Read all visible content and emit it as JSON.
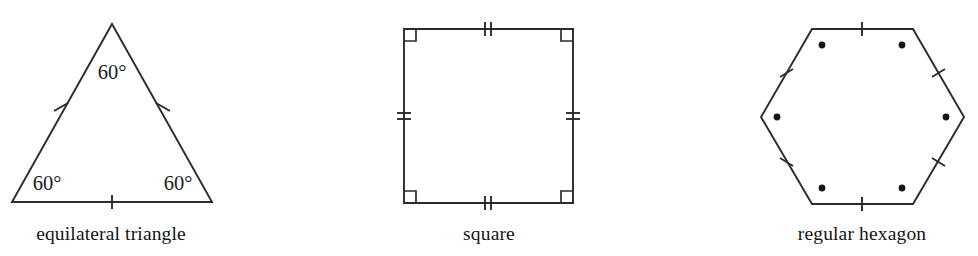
{
  "figure": {
    "background_color": "#ffffff",
    "stroke_color": "#2b2b2e",
    "text_color": "#141417",
    "shapes": [
      {
        "name": "equilateral-triangle",
        "caption": "equilateral triangle",
        "caption_x": 111,
        "caption_y": 240,
        "sides": 3,
        "tick_count": 1,
        "vertex_marker": "none",
        "has_right_angle_marks": false,
        "angle_labels": [
          {
            "text": "60°",
            "x": 112,
            "y": 79
          },
          {
            "text": "60°",
            "x": 47,
            "y": 190
          },
          {
            "text": "60°",
            "x": 178,
            "y": 190
          }
        ],
        "points": "112,24 212,202 12,202",
        "tick_segments": [
          {
            "x1": 54,
            "y1": 111,
            "x2": 68,
            "y2": 103
          },
          {
            "x1": 156,
            "y1": 103,
            "x2": 170,
            "y2": 111
          },
          {
            "x1": 112,
            "y1": 195,
            "x2": 112,
            "y2": 209
          }
        ]
      },
      {
        "name": "square",
        "caption": "square",
        "caption_x": 489,
        "caption_y": 240,
        "sides": 4,
        "tick_count": 2,
        "vertex_marker": "right-angle",
        "has_right_angle_marks": true,
        "angle_labels": [],
        "points": "404,29 573,29 573,203 404,203",
        "tick_segments": [
          {
            "x1": 485,
            "y1": 22,
            "x2": 485,
            "y2": 36
          },
          {
            "x1": 491,
            "y1": 22,
            "x2": 491,
            "y2": 36
          },
          {
            "x1": 485,
            "y1": 196,
            "x2": 485,
            "y2": 210
          },
          {
            "x1": 491,
            "y1": 196,
            "x2": 491,
            "y2": 210
          },
          {
            "x1": 397,
            "y1": 113,
            "x2": 411,
            "y2": 113
          },
          {
            "x1": 397,
            "y1": 119,
            "x2": 411,
            "y2": 119
          },
          {
            "x1": 566,
            "y1": 113,
            "x2": 580,
            "y2": 113
          },
          {
            "x1": 566,
            "y1": 119,
            "x2": 580,
            "y2": 119
          }
        ],
        "right_angle_marks": [
          {
            "d": "M 404,41 L 416,41 L 416,29"
          },
          {
            "d": "M 573,41 L 561,41 L 561,29"
          },
          {
            "d": "M 573,191 L 561,191 L 561,203"
          },
          {
            "d": "M 404,191 L 416,191 L 416,203"
          }
        ]
      },
      {
        "name": "regular-hexagon",
        "caption": "regular hexagon",
        "caption_x": 862,
        "caption_y": 240,
        "sides": 6,
        "tick_count": 1,
        "vertex_marker": "dot",
        "has_right_angle_marks": false,
        "angle_labels": [],
        "points": "812,29 913,29 964,117 913,204 812,204 761,117",
        "tick_segments": [
          {
            "x1": 862,
            "y1": 22,
            "x2": 862,
            "y2": 36
          },
          {
            "x1": 932,
            "y1": 77,
            "x2": 945,
            "y2": 69
          },
          {
            "x1": 932,
            "y1": 158,
            "x2": 945,
            "y2": 166
          },
          {
            "x1": 862,
            "y1": 197,
            "x2": 862,
            "y2": 211
          },
          {
            "x1": 780,
            "y1": 158,
            "x2": 793,
            "y2": 166
          },
          {
            "x1": 780,
            "y1": 77,
            "x2": 793,
            "y2": 69
          }
        ],
        "vertex_dots": [
          {
            "cx": 822,
            "cy": 45,
            "r": 3.4
          },
          {
            "cx": 902,
            "cy": 45,
            "r": 3.4
          },
          {
            "cx": 946,
            "cy": 117,
            "r": 3.4
          },
          {
            "cx": 902,
            "cy": 188,
            "r": 3.4
          },
          {
            "cx": 822,
            "cy": 188,
            "r": 3.4
          },
          {
            "cx": 777,
            "cy": 117,
            "r": 3.4
          }
        ]
      }
    ]
  }
}
